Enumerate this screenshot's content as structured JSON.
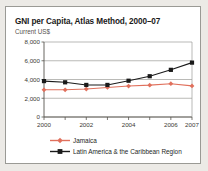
{
  "chart_data": {
    "type": "line",
    "title": "GNI per Capita, Atlas Method, 2000–07",
    "subtitle": "Current US$",
    "xlabel": "",
    "ylabel": "Current US$",
    "x": [
      2000,
      2001,
      2002,
      2003,
      2004,
      2005,
      2006,
      2007
    ],
    "xtick_labels": [
      "2000",
      "2002",
      "2004",
      "2006",
      "2007"
    ],
    "xticks": [
      2000,
      2002,
      2004,
      2006,
      2007
    ],
    "ytick_labels": [
      "0",
      "2,000",
      "4,000",
      "6,000",
      "8,000"
    ],
    "yticks": [
      0,
      2000,
      4000,
      6000,
      8000
    ],
    "ylim": [
      0,
      8000
    ],
    "xlim": [
      2000,
      2007
    ],
    "grid": true,
    "legend_position": "bottom-left",
    "series": [
      {
        "name": "Jamaica",
        "color": "#e0705c",
        "marker": "diamond",
        "values": [
          2900,
          2900,
          2980,
          3150,
          3300,
          3400,
          3550,
          3320
        ]
      },
      {
        "name": "Latin America & the Caribbean Region",
        "color": "#1a1a1a",
        "marker": "square",
        "values": [
          3830,
          3700,
          3420,
          3420,
          3870,
          4350,
          5030,
          5800
        ]
      }
    ]
  },
  "legend": {
    "items": [
      {
        "label": "Jamaica"
      },
      {
        "label": "Latin America & the Caribbean Region"
      }
    ]
  },
  "colors": {
    "jamaica": "#e0705c",
    "latin_america": "#1a1a1a",
    "grid": "#9c9c98",
    "axis": "#58564f",
    "panel_background": "#ffffff",
    "page_background": "#eceae6",
    "panel_border": "#9a9a95"
  }
}
